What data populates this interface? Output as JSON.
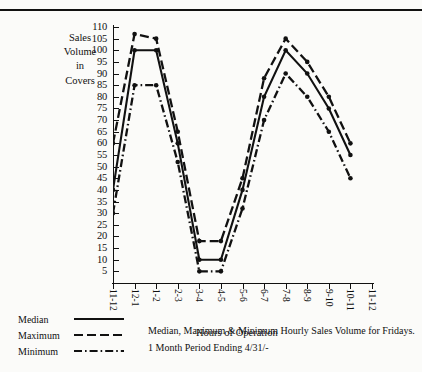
{
  "chart_data": {
    "type": "line",
    "title": "Median, Maximum & Minimum Hourly Sales Volume for Fridays.",
    "subtitle": "1 Month Period Ending 4/31/-",
    "xlabel": "Hours of Operation",
    "ylabel": "Sales Volume in Covers",
    "ylabel_lines": [
      "Sales",
      "Volume",
      "in",
      "Covers"
    ],
    "categories": [
      "11-12",
      "12-1",
      "1-2",
      "2-3",
      "3-4",
      "4-5",
      "5-6",
      "6-7",
      "7-8",
      "8-9",
      "9-10",
      "10-11",
      "11-12"
    ],
    "ylim": [
      0,
      110
    ],
    "yticks": [
      5,
      10,
      15,
      20,
      25,
      30,
      35,
      40,
      45,
      50,
      55,
      60,
      65,
      70,
      75,
      80,
      85,
      90,
      95,
      100,
      105,
      110
    ],
    "grid": false,
    "legend_position": "bottom-left",
    "series": [
      {
        "name": "Median",
        "style": "solid",
        "x": [
          "11-12",
          "12-1",
          "1-2",
          "2-3",
          "3-4",
          "4-5",
          "5-6",
          "6-7",
          "7-8",
          "8-9",
          "9-10",
          "10-11"
        ],
        "values": [
          40,
          100,
          100,
          60,
          10,
          10,
          40,
          80,
          100,
          90,
          75,
          55
        ]
      },
      {
        "name": "Maximum",
        "style": "dashed",
        "x": [
          "11-12",
          "12-1",
          "1-2",
          "2-3",
          "3-4",
          "4-5",
          "5-6",
          "6-7",
          "7-8",
          "8-9",
          "9-10",
          "10-11"
        ],
        "values": [
          60,
          107,
          105,
          65,
          18,
          18,
          45,
          88,
          105,
          95,
          80,
          60
        ]
      },
      {
        "name": "Minimum",
        "style": "dashdot",
        "x": [
          "11-12",
          "12-1",
          "1-2",
          "2-3",
          "3-4",
          "4-5",
          "5-6",
          "6-7",
          "7-8",
          "8-9",
          "9-10",
          "10-11"
        ],
        "values": [
          30,
          85,
          85,
          52,
          5,
          5,
          32,
          70,
          90,
          80,
          65,
          45
        ]
      }
    ]
  },
  "legend": {
    "items": [
      {
        "label": "Median",
        "style": "solid"
      },
      {
        "label": "Maximum",
        "style": "dashed"
      },
      {
        "label": "Minimum",
        "style": "dashdot"
      }
    ]
  },
  "colors": {
    "ink": "#111111",
    "paper": "#fbfbf9"
  }
}
